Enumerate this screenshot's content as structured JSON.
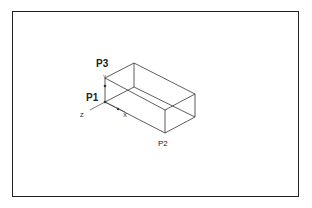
{
  "diagram": {
    "type": "isometric-box",
    "points": {
      "p1": {
        "label": "P1"
      },
      "p2": {
        "label": "P2"
      },
      "p3": {
        "label": "P3"
      }
    },
    "axes": {
      "x": {
        "label": "X"
      },
      "y": {
        "label": "Y"
      },
      "z": {
        "label": "Z"
      }
    },
    "colors": {
      "line": "#333333",
      "frame": "#222222"
    }
  }
}
